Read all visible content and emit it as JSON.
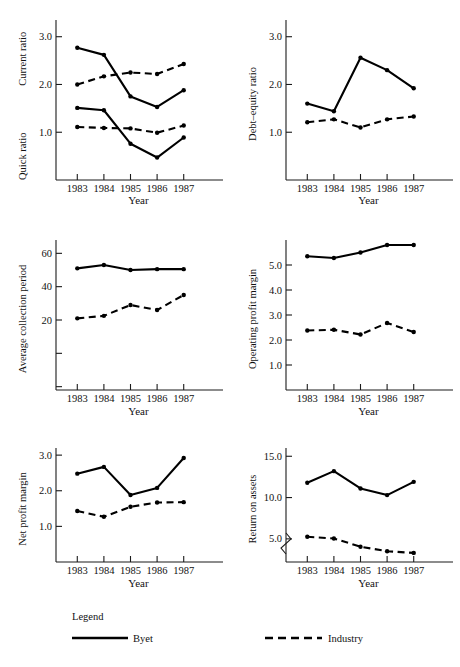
{
  "figure": {
    "xlabel": "Year",
    "categories": [
      "1983",
      "1984",
      "1985",
      "1986",
      "1987"
    ]
  },
  "legend": {
    "caption": "Legend",
    "byet_label": "Byet",
    "industry_label": "Industry",
    "byet_style": "solid",
    "industry_style": "dashed",
    "line_color": "#000000"
  },
  "chart_data": [
    {
      "type": "line",
      "panel": "current-quick-ratio",
      "title": "",
      "xlabel": "Year",
      "ylabel": "Current ratio / Quick ratio",
      "ylabel_upper": "Current ratio",
      "ylabel_lower": "Quick ratio",
      "x": [
        "1983",
        "1984",
        "1985",
        "1986",
        "1987"
      ],
      "yticks": [
        1.0,
        2.0,
        3.0
      ],
      "ytick_labels": [
        "1.0",
        "2.0",
        "3.0"
      ],
      "ylim": [
        0.0,
        3.35
      ],
      "grid": false,
      "series": [
        {
          "name": "Byet",
          "metric": "Current ratio",
          "style": "solid",
          "values": [
            2.77,
            2.62,
            1.75,
            1.53,
            1.88
          ]
        },
        {
          "name": "Industry",
          "metric": "Current ratio",
          "style": "dashed",
          "values": [
            2.0,
            2.17,
            2.25,
            2.22,
            2.43
          ]
        },
        {
          "name": "Byet",
          "metric": "Quick ratio",
          "style": "solid",
          "values": [
            1.51,
            1.46,
            0.76,
            0.47,
            0.89
          ]
        },
        {
          "name": "Industry",
          "metric": "Quick ratio",
          "style": "dashed",
          "values": [
            1.11,
            1.09,
            1.08,
            0.99,
            1.14
          ]
        }
      ]
    },
    {
      "type": "line",
      "panel": "debt-equity-ratio",
      "title": "",
      "xlabel": "Year",
      "ylabel": "Debt–equity ratio",
      "x": [
        "1983",
        "1984",
        "1985",
        "1986",
        "1987"
      ],
      "yticks": [
        1.0,
        2.0,
        3.0
      ],
      "ytick_labels": [
        "1.0",
        "2.0",
        "3.0"
      ],
      "ylim": [
        0.0,
        3.35
      ],
      "grid": false,
      "series": [
        {
          "name": "Byet",
          "style": "solid",
          "values": [
            1.6,
            1.44,
            2.56,
            2.3,
            1.92
          ]
        },
        {
          "name": "Industry",
          "style": "dashed",
          "values": [
            1.21,
            1.27,
            1.1,
            1.27,
            1.33
          ]
        }
      ]
    },
    {
      "type": "line",
      "panel": "average-collection-period",
      "title": "",
      "xlabel": "Year",
      "ylabel": "Average collection period",
      "x": [
        "1983",
        "1984",
        "1985",
        "1986",
        "1987"
      ],
      "yticks": [
        20,
        40,
        60
      ],
      "ytick_labels": [
        "20",
        "40",
        "60"
      ],
      "ylim": [
        -22,
        68
      ],
      "grid": false,
      "series": [
        {
          "name": "Byet",
          "style": "solid",
          "values": [
            51,
            53,
            50,
            50.5,
            50.5
          ]
        },
        {
          "name": "Industry",
          "style": "dashed",
          "values": [
            21,
            22.5,
            29,
            26,
            35
          ]
        }
      ]
    },
    {
      "type": "line",
      "panel": "operating-profit-margin",
      "title": "",
      "xlabel": "Year",
      "ylabel": "Operating profit margin",
      "x": [
        "1983",
        "1984",
        "1985",
        "1986",
        "1987"
      ],
      "yticks": [
        1.0,
        2.0,
        3.0,
        4.0,
        5.0
      ],
      "ytick_labels": [
        "1.0",
        "2.0",
        "3.0",
        "4.0",
        "5.0"
      ],
      "ylim": [
        0.0,
        6.0
      ],
      "grid": false,
      "series": [
        {
          "name": "Byet",
          "style": "solid",
          "values": [
            5.35,
            5.28,
            5.5,
            5.8,
            5.8
          ]
        },
        {
          "name": "Industry",
          "style": "dashed",
          "values": [
            2.38,
            2.41,
            2.22,
            2.68,
            2.32
          ]
        }
      ]
    },
    {
      "type": "line",
      "panel": "net-profit-margin",
      "title": "",
      "xlabel": "Year",
      "ylabel": "Net profit margin",
      "x": [
        "1983",
        "1984",
        "1985",
        "1986",
        "1987"
      ],
      "yticks": [
        1.0,
        2.0,
        3.0
      ],
      "ytick_labels": [
        "1.0",
        "2.0",
        "3.0"
      ],
      "ylim": [
        0.0,
        3.2
      ],
      "grid": false,
      "series": [
        {
          "name": "Byet",
          "style": "solid",
          "values": [
            2.48,
            2.67,
            1.88,
            2.08,
            2.92
          ]
        },
        {
          "name": "Industry",
          "style": "dashed",
          "values": [
            1.43,
            1.27,
            1.55,
            1.67,
            1.68
          ]
        }
      ]
    },
    {
      "type": "line",
      "panel": "return-on-assets",
      "title": "",
      "xlabel": "Year",
      "ylabel": "Return on assets",
      "x": [
        "1983",
        "1984",
        "1985",
        "1986",
        "1987"
      ],
      "yticks": [
        5.0,
        10.0,
        15.0
      ],
      "ytick_labels": [
        "5.0",
        "10.0",
        "15.0"
      ],
      "ylim": [
        2.2,
        16.0
      ],
      "axis_break": true,
      "grid": false,
      "series": [
        {
          "name": "Byet",
          "style": "solid",
          "values": [
            11.8,
            13.2,
            11.1,
            10.3,
            11.9
          ]
        },
        {
          "name": "Industry",
          "style": "dashed",
          "values": [
            5.25,
            5.05,
            4.05,
            3.5,
            3.3
          ]
        }
      ]
    }
  ]
}
